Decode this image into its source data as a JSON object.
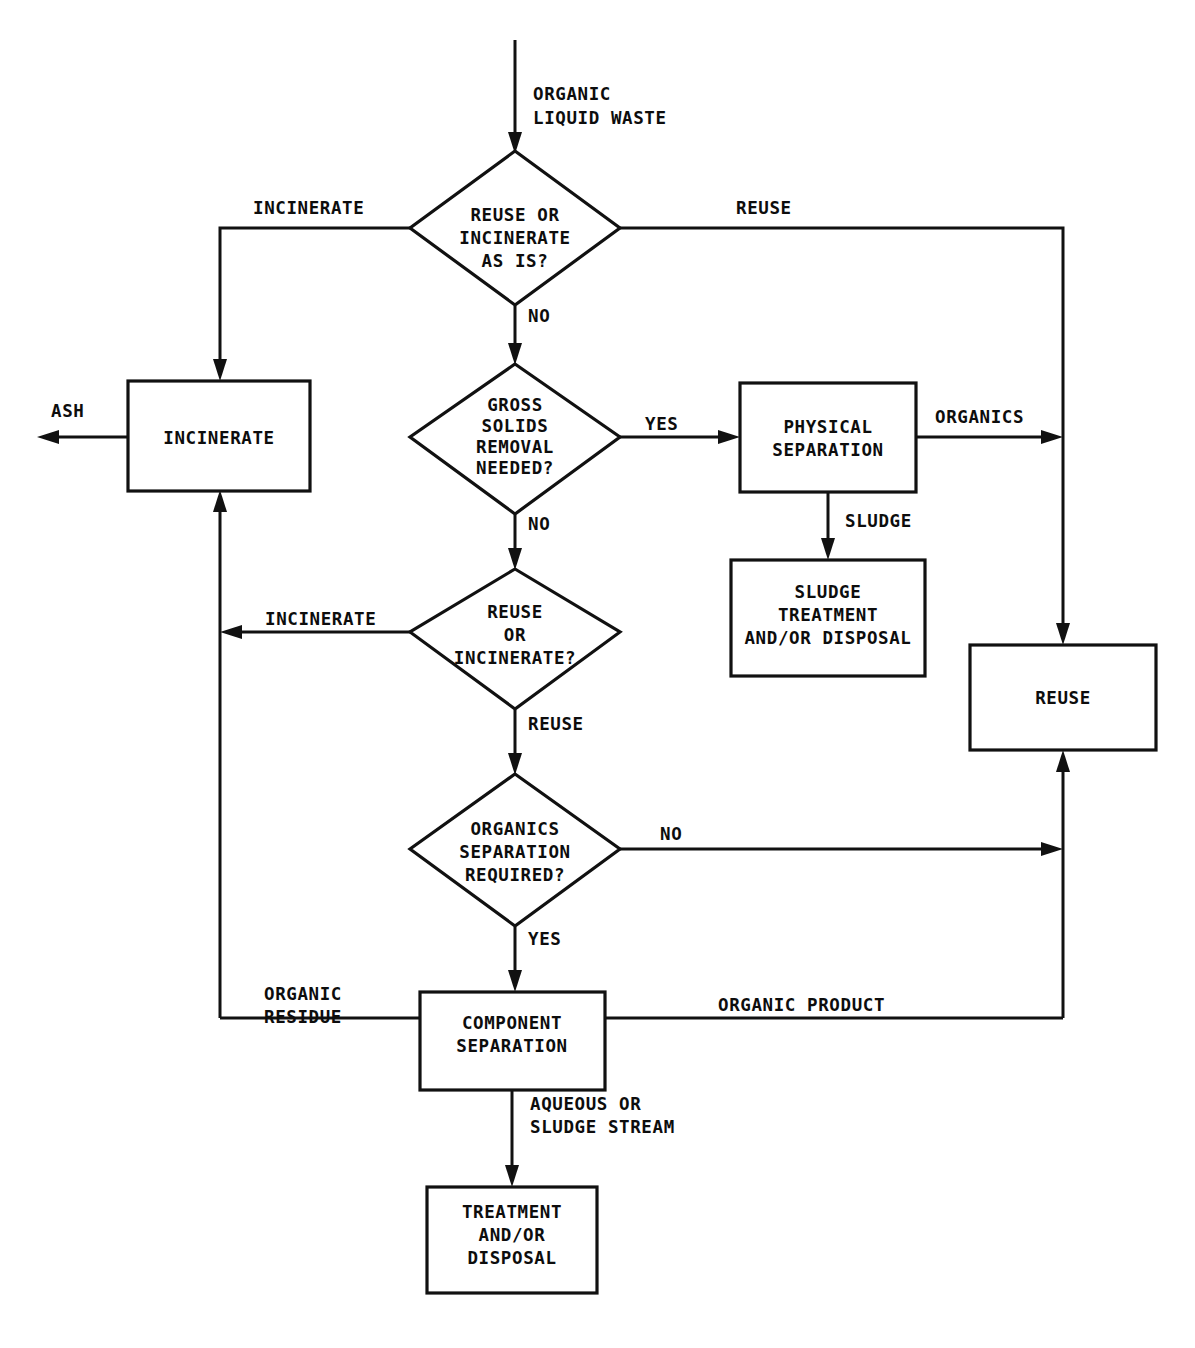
{
  "diagram": {
    "type": "flowchart",
    "stroke_color": "#111111",
    "fill_color": "#ffffff",
    "text_color": "#0d0d0d"
  },
  "nodes": {
    "start_stream": {
      "kind": "stream-label",
      "line1": "ORGANIC",
      "line2": "LIQUID WASTE"
    },
    "decision_reuse_or_incinerate_as_is": {
      "kind": "decision",
      "line1": "REUSE OR",
      "line2": "INCINERATE",
      "line3": "AS IS?"
    },
    "process_incinerate": {
      "kind": "process",
      "line1": "INCINERATE"
    },
    "decision_gross_solids": {
      "kind": "decision",
      "line1": "GROSS",
      "line2": "SOLIDS",
      "line3": "REMOVAL",
      "line4": "NEEDED?"
    },
    "process_physical_separation": {
      "kind": "process",
      "line1": "PHYSICAL",
      "line2": "SEPARATION"
    },
    "process_sludge_treatment": {
      "kind": "process",
      "line1": "SLUDGE",
      "line2": "TREATMENT",
      "line3": "AND/OR DISPOSAL"
    },
    "decision_reuse_or_incinerate": {
      "kind": "decision",
      "line1": "REUSE",
      "line2": "OR",
      "line3": "INCINERATE?"
    },
    "process_reuse": {
      "kind": "process",
      "line1": "REUSE"
    },
    "decision_organics_separation": {
      "kind": "decision",
      "line1": "ORGANICS",
      "line2": "SEPARATION",
      "line3": "REQUIRED?"
    },
    "process_component_separation": {
      "kind": "process",
      "line1": "COMPONENT",
      "line2": "SEPARATION"
    },
    "process_treatment_disposal": {
      "kind": "process",
      "line1": "TREATMENT",
      "line2": "AND/OR",
      "line3": "DISPOSAL"
    }
  },
  "edge_labels": {
    "incinerate_top": "INCINERATE",
    "reuse_top": "REUSE",
    "no_after_as_is": "NO",
    "ash": "ASH",
    "yes_gross_solids": "YES",
    "no_gross_solids": "NO",
    "organics": "ORGANICS",
    "sludge": "SLUDGE",
    "incinerate_mid": "INCINERATE",
    "reuse_mid": "REUSE",
    "no_organics_separation": "NO",
    "yes_organics_separation": "YES",
    "organic_residue_l1": "ORGANIC",
    "organic_residue_l2": "RESIDUE",
    "organic_product": "ORGANIC PRODUCT",
    "aqueous_l1": "AQUEOUS OR",
    "aqueous_l2": "SLUDGE STREAM"
  }
}
